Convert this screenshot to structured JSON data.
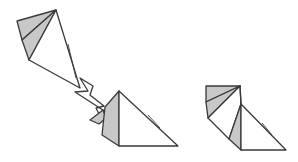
{
  "diagram": {
    "type": "origami-fold-diagram",
    "steps": [
      {
        "name": "initial-model",
        "description": "Kite-shaped model with layered gray flaps at top-left"
      },
      {
        "name": "fold-result-intermediate",
        "description": "Flap squashed down, shown with arrow indicating motion"
      },
      {
        "name": "fold-result-final",
        "description": "Resulting model with two stacked gray flaps"
      }
    ],
    "colors": {
      "paper_back": "#c8c8c8",
      "paper_front": "#ffffff",
      "line": "#3a3a3a"
    },
    "arrow": {
      "name": "fold-arrow",
      "meaning": "move flap down-right"
    }
  }
}
